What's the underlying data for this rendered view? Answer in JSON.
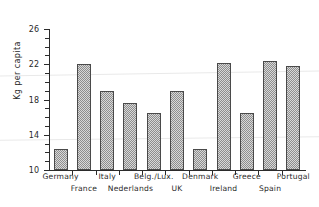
{
  "chart_data": {
    "type": "bar",
    "title": "",
    "xlabel": "",
    "ylabel": "Kg per capita",
    "ylim": [
      10,
      26
    ],
    "yticks_major": [
      10,
      14,
      18,
      22,
      26
    ],
    "yticks_minor": [
      11,
      12,
      13,
      15,
      16,
      17,
      19,
      20,
      21,
      23,
      24,
      25
    ],
    "grid": false,
    "legend": "none",
    "categories": [
      "Germany",
      "France",
      "Italy",
      "Nederlands",
      "Belg./Lux.",
      "UK",
      "Denmark",
      "Ireland",
      "Greece",
      "Spain",
      "Portugal"
    ],
    "values": [
      12.4,
      22.0,
      19.0,
      17.6,
      16.5,
      19.0,
      12.4,
      22.1,
      16.5,
      22.4,
      21.8
    ],
    "bar_facecolor": "#d8d8d8",
    "bar_edgecolor": "#4a4a4a",
    "axis_color": "#2b2b2b"
  },
  "axis": {
    "y_title": "Kg per capita",
    "tick_labels": [
      "26",
      "22",
      "18",
      "14",
      "10"
    ]
  }
}
